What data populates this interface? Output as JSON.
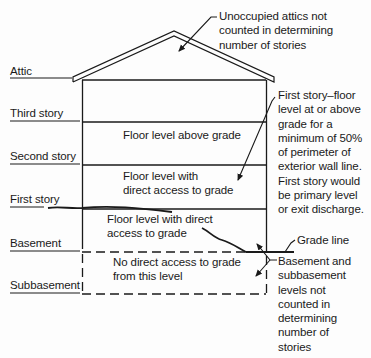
{
  "colors": {
    "ink": "#1a1a1a",
    "background": "#fdfdfd"
  },
  "levels": [
    {
      "id": "attic",
      "label": "Attic",
      "y": 70
    },
    {
      "id": "third-story",
      "label": "Third story",
      "y": 106
    },
    {
      "id": "second-story",
      "label": "Second story",
      "y": 149
    },
    {
      "id": "first-story",
      "label": "First story",
      "y": 192
    },
    {
      "id": "basement",
      "label": "Basement",
      "y": 236
    },
    {
      "id": "subbasement",
      "label": "Subbasement",
      "y": 278
    }
  ],
  "floor_texts": {
    "above_grade": "Floor level above grade",
    "direct_access_1": [
      "Floor level with",
      "direct access to grade"
    ],
    "direct_access_2": [
      "Floor level with direct",
      "access to grade"
    ],
    "no_access": [
      "No direct access to grade",
      "from this level"
    ]
  },
  "notes": {
    "attic_note": [
      "Unoccupied attics not",
      "counted in determining",
      "number of stories"
    ],
    "first_story_note": [
      "First  story–floor",
      "level at or above",
      "grade for a",
      "minimum of 50%",
      "of perimeter of",
      "exterior wall line.",
      "First story would",
      "be primary level",
      "or exit discharge."
    ],
    "grade_line": "Grade line",
    "basement_note": [
      "Basement and",
      "subbasement",
      "levels not",
      "counted in",
      "determining",
      "number of",
      "stories"
    ]
  }
}
